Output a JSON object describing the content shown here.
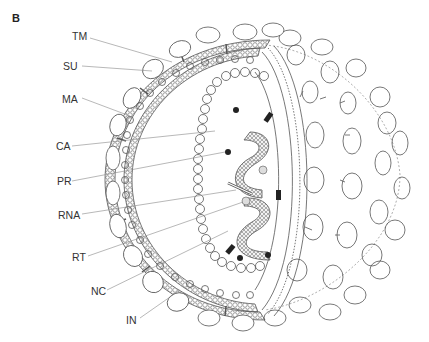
{
  "figure": {
    "panel": "B"
  },
  "labels": [
    {
      "id": "tm",
      "text": "TM",
      "x": 72,
      "y": 33
    },
    {
      "id": "su",
      "text": "SU",
      "x": 63,
      "y": 60
    },
    {
      "id": "ma",
      "text": "MA",
      "x": 62,
      "y": 93
    },
    {
      "id": "ca",
      "text": "CA",
      "x": 56,
      "y": 140
    },
    {
      "id": "pr",
      "text": "PR",
      "x": 57,
      "y": 175
    },
    {
      "id": "rna",
      "text": "RNA",
      "x": 58,
      "y": 209
    },
    {
      "id": "rt",
      "text": "RT",
      "x": 72,
      "y": 251
    },
    {
      "id": "nc",
      "text": "NC",
      "x": 91,
      "y": 285
    },
    {
      "id": "in",
      "text": "IN",
      "x": 126,
      "y": 314
    }
  ],
  "colors": {
    "line": "#555555",
    "leader": "#888888",
    "fill_dark": "#222222"
  }
}
